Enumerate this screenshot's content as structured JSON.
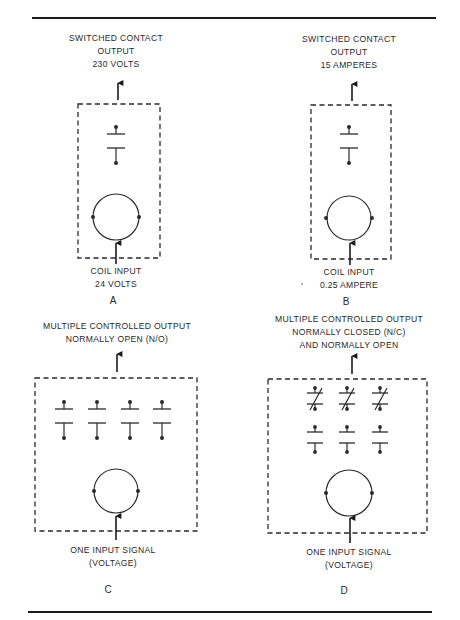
{
  "figure": {
    "panels": [
      {
        "id": "A",
        "letter": "A",
        "output_label": [
          "SWITCHED CONTACT",
          "OUTPUT",
          "230 VOLTS"
        ],
        "input_label": [
          "COIL INPUT",
          "24 VOLTS"
        ],
        "contacts": {
          "normally_open": 1,
          "normally_closed": 0
        }
      },
      {
        "id": "B",
        "letter": "B",
        "output_label": [
          "SWITCHED CONTACT",
          "OUTPUT",
          "15 AMPERES"
        ],
        "input_label": [
          "COIL INPUT",
          "0.25 AMPERE"
        ],
        "contacts": {
          "normally_open": 1,
          "normally_closed": 0
        }
      },
      {
        "id": "C",
        "letter": "C",
        "output_label": [
          "MULTIPLE CONTROLLED OUTPUT",
          "NORMALLY OPEN (N/O)"
        ],
        "input_label": [
          "ONE INPUT SIGNAL",
          "(VOLTAGE)"
        ],
        "contacts": {
          "normally_open": 4,
          "normally_closed": 0
        }
      },
      {
        "id": "D",
        "letter": "D",
        "output_label": [
          "MULTIPLE CONTROLLED OUTPUT",
          "NORMALLY CLOSED (N/C)",
          "AND NORMALLY OPEN"
        ],
        "input_label": [
          "ONE INPUT SIGNAL",
          "(VOLTAGE)"
        ],
        "contacts": {
          "normally_open": 3,
          "normally_closed": 3
        }
      }
    ],
    "colors": {
      "ink": "#2a2a2a",
      "rule": "#1a1a1a",
      "background": "#ffffff"
    }
  }
}
